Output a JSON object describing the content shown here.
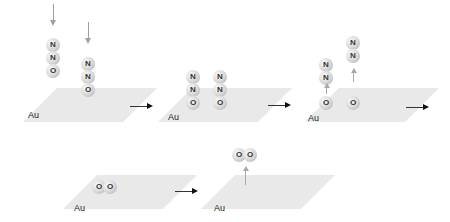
{
  "diagram": {
    "surface_label": "Au",
    "atom_labels": {
      "nitrogen": "N",
      "oxygen": "O"
    },
    "steps": [
      {
        "name": "adsorption",
        "molecules": [
          "N2O",
          "N2O"
        ],
        "arrows": "incoming"
      },
      {
        "name": "adsorbed",
        "molecules": [
          "N2O",
          "N2O"
        ]
      },
      {
        "name": "N2 desorption",
        "molecules": [
          "N2",
          "N2"
        ],
        "remaining": [
          "O",
          "O"
        ]
      },
      {
        "name": "O recombination",
        "molecules": [
          "O2"
        ]
      },
      {
        "name": "O2 desorption",
        "molecules": [
          "O2"
        ]
      }
    ],
    "colors": {
      "surface": "#e9e9e9",
      "atom": "#d6d6d6",
      "arrow": "#111111",
      "vertical_arrow": "#a0a0a0"
    }
  }
}
